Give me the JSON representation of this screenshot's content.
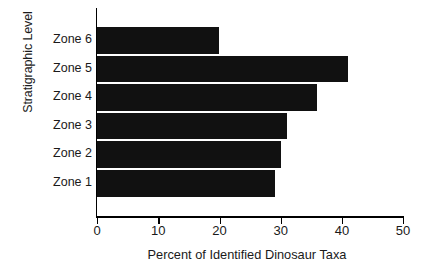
{
  "chart_data": {
    "type": "bar",
    "orientation": "horizontal",
    "title": "",
    "xlabel": "Percent of Identified Dinosaur Taxa",
    "ylabel": "Stratigraphic Level",
    "categories": [
      "Zone 1",
      "Zone 2",
      "Zone 3",
      "Zone 4",
      "Zone 5",
      "Zone 6"
    ],
    "values": [
      29,
      30,
      31,
      36,
      41,
      20
    ],
    "series": [
      {
        "name": "Percent of Identified Dinosaur Taxa",
        "values": [
          29,
          30,
          31,
          36,
          41,
          20
        ]
      }
    ],
    "display_order_top_to_bottom": [
      "Zone 6",
      "Zone 5",
      "Zone 4",
      "Zone 3",
      "Zone 2",
      "Zone 1"
    ],
    "bars": [
      {
        "category": "Zone 6",
        "value": 20
      },
      {
        "category": "Zone 5",
        "value": 41
      },
      {
        "category": "Zone 4",
        "value": 36
      },
      {
        "category": "Zone 3",
        "value": 31
      },
      {
        "category": "Zone 2",
        "value": 30
      },
      {
        "category": "Zone 1",
        "value": 29
      }
    ],
    "xlim": [
      0,
      50
    ],
    "xticks": [
      0,
      10,
      20,
      30,
      40,
      50
    ],
    "xtick_labels": [
      "0",
      "10",
      "20",
      "30",
      "40",
      "50"
    ],
    "grid": false,
    "legend": false,
    "bar_color": "#111111",
    "axis_color": "#000000",
    "background_color": "#ffffff"
  }
}
